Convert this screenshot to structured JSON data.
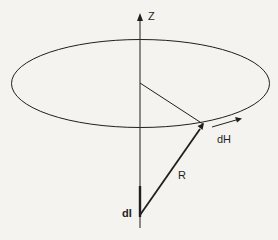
{
  "diagram": {
    "labels": {
      "z_axis": "Z",
      "field_element": "dH",
      "distance_vector": "R",
      "current_element": "dI"
    },
    "colors": {
      "background": "#f4f3ef",
      "stroke": "#1f1f1f"
    },
    "elements": [
      {
        "name": "z-axis",
        "type": "arrow",
        "label": "Z"
      },
      {
        "name": "circle-path",
        "type": "ellipse"
      },
      {
        "name": "radius-line",
        "type": "line"
      },
      {
        "name": "r-vector",
        "type": "arrow",
        "label": "R"
      },
      {
        "name": "dh-vector",
        "type": "arrow",
        "label": "dH"
      },
      {
        "name": "current-element",
        "type": "thick-segment",
        "label": "dI"
      }
    ]
  }
}
